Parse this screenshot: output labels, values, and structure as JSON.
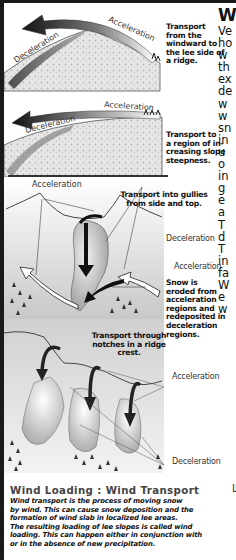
{
  "figure": {
    "panel1": {
      "acceleration_label": "Acceleration",
      "deceleration_label": "Deceleration",
      "caption_lines": [
        "Transport",
        "from the",
        "windward to",
        "the lee side of",
        "a ridge."
      ]
    },
    "panel2": {
      "acceleration_label": "Acceleration",
      "deceleration_label": "Deceleration",
      "caption_lines": [
        "Transport to",
        "a region of in-",
        "creasing slope",
        "steepness."
      ]
    },
    "panel3": {
      "acceleration_top_label": "Acceleration",
      "gully_caption_lines": [
        "Transport into gullies",
        "from side and top."
      ],
      "deceleration_label": "Deceleration",
      "acceleration_right_label": "Acceleration",
      "erosion_caption_lines": [
        "Snow is",
        "eroded from",
        "acceleration",
        "regions and",
        "redeposited in",
        "deceleration",
        "regions."
      ]
    },
    "panel4": {
      "notch_caption_lines": [
        "Transport through",
        "notches in a ridge",
        "crest."
      ],
      "acceleration_label": "Acceleration",
      "deceleration_label": "Deceleration"
    }
  },
  "right_column": {
    "heading": "W",
    "lines": [
      "Ve",
      "ho",
      "w",
      "th",
      "ex",
      "de",
      "w",
      "w",
      "sn",
      "in",
      "u",
      "o",
      "in",
      "g",
      "e",
      "a",
      "T",
      "d",
      "T",
      "in",
      "fa",
      "W",
      "e",
      "w"
    ],
    "stray_letter": "L"
  },
  "caption": {
    "title": "Wind Loading : Wind Transport",
    "body_lines": [
      "Wind transport is the process of moving snow",
      "by wind. This can cause snow deposition and the",
      "formation of wind slab in localized lee areas.",
      "The resulting loading of lee slopes is called wind",
      "loading. This can happen either in conjunction with",
      "or in the absence of new precipitation."
    ]
  }
}
